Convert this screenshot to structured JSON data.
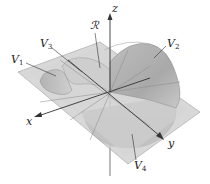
{
  "figure": {
    "axes": {
      "x": "x",
      "y": "y",
      "z": "z"
    },
    "labels": {
      "region": "ℛ",
      "v1": {
        "base": "V",
        "sub": "1"
      },
      "v2": {
        "base": "V",
        "sub": "2"
      },
      "v3": {
        "base": "V",
        "sub": "3"
      },
      "v4": {
        "base": "V",
        "sub": "4"
      }
    },
    "colors": {
      "plane": "#c9c9c9",
      "plane_edge": "#9a9a9a",
      "surface_light": "#d6d6d6",
      "surface_mid": "#b8b8b8",
      "surface_dark": "#9f9f9f",
      "axis": "#333333"
    }
  }
}
